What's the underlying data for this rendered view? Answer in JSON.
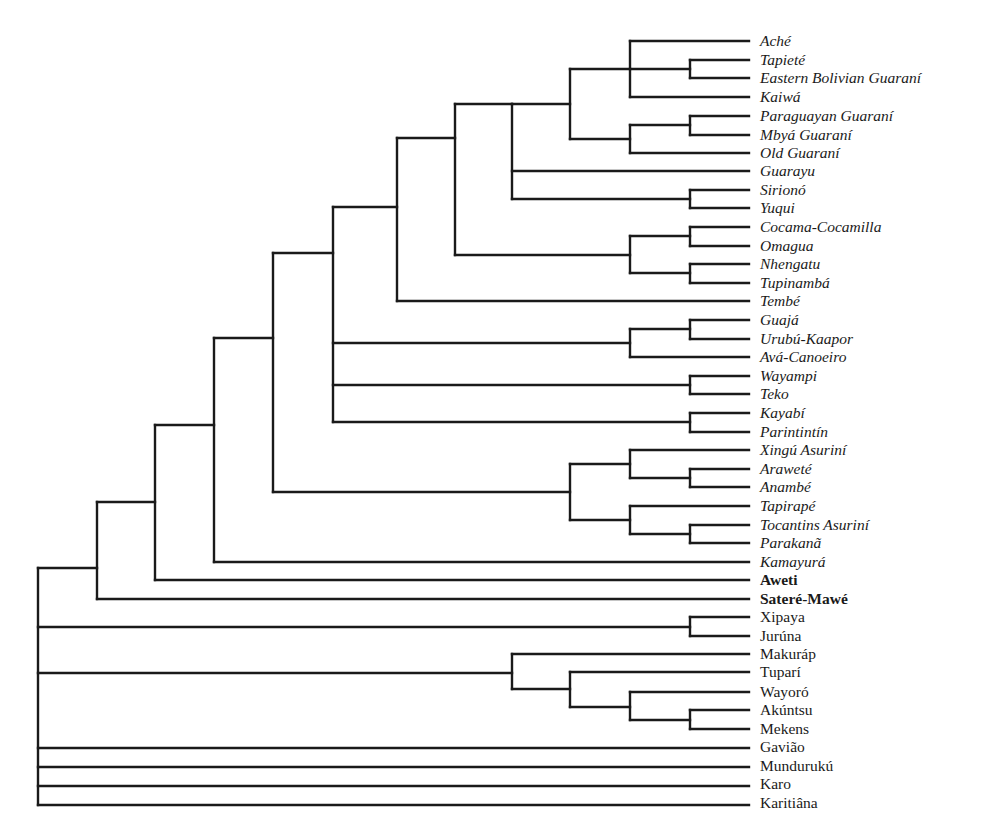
{
  "diagram": {
    "type": "phylogenetic-tree",
    "line_color": "#1a1a1a",
    "label_x": 760,
    "tip_x": 749,
    "leaves": [
      {
        "label": "Aché",
        "y": 41,
        "style": "italic"
      },
      {
        "label": "Tapieté",
        "y": 60,
        "style": "italic"
      },
      {
        "label": "Eastern Bolivian Guaraní",
        "y": 78,
        "style": "italic"
      },
      {
        "label": "Kaiwá",
        "y": 97,
        "style": "italic"
      },
      {
        "label": "Paraguayan Guaraní",
        "y": 116,
        "style": "italic"
      },
      {
        "label": "Mbyá Guaraní",
        "y": 135,
        "style": "italic"
      },
      {
        "label": "Old Guaraní",
        "y": 153,
        "style": "italic"
      },
      {
        "label": "Guarayu",
        "y": 171,
        "style": "italic"
      },
      {
        "label": "Sirionó",
        "y": 190,
        "style": "italic"
      },
      {
        "label": "Yuqui",
        "y": 208,
        "style": "italic"
      },
      {
        "label": "Cocama-Cocamilla",
        "y": 227,
        "style": "italic"
      },
      {
        "label": "Omagua",
        "y": 246,
        "style": "italic"
      },
      {
        "label": "Nhengatu",
        "y": 264,
        "style": "italic"
      },
      {
        "label": "Tupinambá",
        "y": 283,
        "style": "italic"
      },
      {
        "label": "Tembé",
        "y": 301,
        "style": "italic"
      },
      {
        "label": "Guajá",
        "y": 320,
        "style": "italic"
      },
      {
        "label": "Urubú-Kaapor",
        "y": 339,
        "style": "italic"
      },
      {
        "label": "Avá-Canoeiro",
        "y": 357,
        "style": "italic"
      },
      {
        "label": "Wayampi",
        "y": 376,
        "style": "italic"
      },
      {
        "label": "Teko",
        "y": 394,
        "style": "italic"
      },
      {
        "label": "Kayabí",
        "y": 413,
        "style": "italic"
      },
      {
        "label": "Parintintín",
        "y": 432,
        "style": "italic"
      },
      {
        "label": "Xingú Asuriní",
        "y": 450,
        "style": "italic"
      },
      {
        "label": "Araweté",
        "y": 469,
        "style": "italic"
      },
      {
        "label": "Anambé",
        "y": 487,
        "style": "italic"
      },
      {
        "label": "Tapirapé",
        "y": 506,
        "style": "italic"
      },
      {
        "label": "Tocantins Asuriní",
        "y": 525,
        "style": "italic"
      },
      {
        "label": "Parakanã",
        "y": 543,
        "style": "italic"
      },
      {
        "label": "Kamayurá",
        "y": 562,
        "style": "italic"
      },
      {
        "label": "Aweti",
        "y": 580,
        "style": "bold"
      },
      {
        "label": "Sateré-Mawé",
        "y": 599,
        "style": "bold"
      },
      {
        "label": "Xipaya",
        "y": 617,
        "style": "normal"
      },
      {
        "label": "Jurúna",
        "y": 636,
        "style": "normal"
      },
      {
        "label": "Makuráp",
        "y": 654,
        "style": "normal"
      },
      {
        "label": "Tuparí",
        "y": 672,
        "style": "normal"
      },
      {
        "label": "Wayoró",
        "y": 692,
        "style": "normal"
      },
      {
        "label": "Akúntsu",
        "y": 710,
        "style": "normal"
      },
      {
        "label": "Mekens",
        "y": 729,
        "style": "normal"
      },
      {
        "label": "Gavião",
        "y": 747,
        "style": "normal"
      },
      {
        "label": "Mundurukú",
        "y": 766,
        "style": "normal"
      },
      {
        "label": "Karo",
        "y": 784,
        "style": "normal"
      },
      {
        "label": "Karitiâna",
        "y": 803,
        "style": "normal"
      }
    ],
    "nodes": [
      {
        "x": 690,
        "y1": 60,
        "y2": 78,
        "children": [
          {
            "y": 60,
            "to": 749
          },
          {
            "y": 78,
            "to": 749
          }
        ],
        "y": 69
      },
      {
        "x": 630,
        "y1": 41,
        "y2": 97,
        "children": [
          {
            "y": 41,
            "to": 749
          },
          {
            "y": 69,
            "to": 690
          },
          {
            "y": 97,
            "to": 749
          }
        ],
        "y": 69
      },
      {
        "x": 690,
        "y1": 116,
        "y2": 135,
        "children": [
          {
            "y": 116,
            "to": 749
          },
          {
            "y": 135,
            "to": 749
          }
        ],
        "y": 125
      },
      {
        "x": 630,
        "y1": 125,
        "y2": 153,
        "children": [
          {
            "y": 125,
            "to": 690
          },
          {
            "y": 153,
            "to": 749
          }
        ],
        "y": 139
      },
      {
        "x": 570,
        "y1": 69,
        "y2": 139,
        "children": [
          {
            "y": 69,
            "to": 630
          },
          {
            "y": 139,
            "to": 630
          }
        ],
        "y": 104
      },
      {
        "x": 690,
        "y1": 190,
        "y2": 208,
        "children": [
          {
            "y": 190,
            "to": 749
          },
          {
            "y": 208,
            "to": 749
          }
        ],
        "y": 199
      },
      {
        "x": 512,
        "y1": 104,
        "y2": 199,
        "children": [
          {
            "y": 104,
            "to": 570
          },
          {
            "y": 171,
            "to": 749
          },
          {
            "y": 199,
            "to": 690
          }
        ],
        "y": 104
      },
      {
        "x": 690,
        "y1": 227,
        "y2": 246,
        "children": [
          {
            "y": 227,
            "to": 749
          },
          {
            "y": 246,
            "to": 749
          }
        ],
        "y": 236
      },
      {
        "x": 690,
        "y1": 264,
        "y2": 283,
        "children": [
          {
            "y": 264,
            "to": 749
          },
          {
            "y": 283,
            "to": 749
          }
        ],
        "y": 273
      },
      {
        "x": 630,
        "y1": 236,
        "y2": 273,
        "children": [
          {
            "y": 236,
            "to": 690
          },
          {
            "y": 273,
            "to": 690
          }
        ],
        "y": 255
      },
      {
        "x": 455,
        "y1": 104,
        "y2": 255,
        "children": [
          {
            "y": 104,
            "to": 512
          },
          {
            "y": 255,
            "to": 630
          }
        ],
        "y": 138
      },
      {
        "x": 397,
        "y1": 138,
        "y2": 301,
        "children": [
          {
            "y": 138,
            "to": 455
          },
          {
            "y": 301,
            "to": 749
          }
        ],
        "y": 207
      },
      {
        "x": 690,
        "y1": 320,
        "y2": 339,
        "children": [
          {
            "y": 320,
            "to": 749
          },
          {
            "y": 339,
            "to": 749
          }
        ],
        "y": 329
      },
      {
        "x": 630,
        "y1": 329,
        "y2": 357,
        "children": [
          {
            "y": 329,
            "to": 690
          },
          {
            "y": 357,
            "to": 749
          }
        ],
        "y": 343
      },
      {
        "x": 690,
        "y1": 376,
        "y2": 394,
        "children": [
          {
            "y": 376,
            "to": 749
          },
          {
            "y": 394,
            "to": 749
          }
        ],
        "y": 385
      },
      {
        "x": 690,
        "y1": 413,
        "y2": 432,
        "children": [
          {
            "y": 413,
            "to": 749
          },
          {
            "y": 432,
            "to": 749
          }
        ],
        "y": 422
      },
      {
        "x": 333,
        "y1": 207,
        "y2": 422,
        "children": [
          {
            "y": 207,
            "to": 397
          },
          {
            "y": 343,
            "to": 630
          },
          {
            "y": 385,
            "to": 690
          },
          {
            "y": 422,
            "to": 690
          }
        ],
        "y": 253
      },
      {
        "x": 690,
        "y1": 469,
        "y2": 487,
        "children": [
          {
            "y": 469,
            "to": 749
          },
          {
            "y": 487,
            "to": 749
          }
        ],
        "y": 478
      },
      {
        "x": 630,
        "y1": 450,
        "y2": 478,
        "children": [
          {
            "y": 450,
            "to": 749
          },
          {
            "y": 478,
            "to": 690
          }
        ],
        "y": 464
      },
      {
        "x": 690,
        "y1": 525,
        "y2": 543,
        "children": [
          {
            "y": 525,
            "to": 749
          },
          {
            "y": 543,
            "to": 749
          }
        ],
        "y": 534
      },
      {
        "x": 630,
        "y1": 506,
        "y2": 534,
        "children": [
          {
            "y": 506,
            "to": 749
          },
          {
            "y": 534,
            "to": 690
          }
        ],
        "y": 520
      },
      {
        "x": 570,
        "y1": 464,
        "y2": 520,
        "children": [
          {
            "y": 464,
            "to": 630
          },
          {
            "y": 520,
            "to": 630
          }
        ],
        "y": 492
      },
      {
        "x": 273,
        "y1": 253,
        "y2": 492,
        "children": [
          {
            "y": 253,
            "to": 333
          },
          {
            "y": 492,
            "to": 570
          }
        ],
        "y": 338
      },
      {
        "x": 214,
        "y1": 338,
        "y2": 562,
        "children": [
          {
            "y": 338,
            "to": 273
          },
          {
            "y": 562,
            "to": 749
          }
        ],
        "y": 425
      },
      {
        "x": 155,
        "y1": 425,
        "y2": 580,
        "children": [
          {
            "y": 425,
            "to": 214
          },
          {
            "y": 580,
            "to": 749
          }
        ],
        "y": 502
      },
      {
        "x": 97,
        "y1": 502,
        "y2": 599,
        "children": [
          {
            "y": 502,
            "to": 155
          },
          {
            "y": 599,
            "to": 749
          }
        ],
        "y": 568
      },
      {
        "x": 690,
        "y1": 617,
        "y2": 636,
        "children": [
          {
            "y": 617,
            "to": 749
          },
          {
            "y": 636,
            "to": 749
          }
        ],
        "y": 627
      },
      {
        "x": 690,
        "y1": 710,
        "y2": 729,
        "children": [
          {
            "y": 710,
            "to": 749
          },
          {
            "y": 729,
            "to": 749
          }
        ],
        "y": 720
      },
      {
        "x": 630,
        "y1": 692,
        "y2": 720,
        "children": [
          {
            "y": 692,
            "to": 749
          },
          {
            "y": 720,
            "to": 690
          }
        ],
        "y": 707
      },
      {
        "x": 570,
        "y1": 672,
        "y2": 707,
        "children": [
          {
            "y": 672,
            "to": 749
          },
          {
            "y": 707,
            "to": 630
          }
        ],
        "y": 689
      },
      {
        "x": 512,
        "y1": 654,
        "y2": 689,
        "children": [
          {
            "y": 654,
            "to": 749
          },
          {
            "y": 689,
            "to": 570
          }
        ],
        "y": 673
      },
      {
        "x": 38,
        "y1": 568,
        "y2": 805,
        "children": [
          {
            "y": 568,
            "to": 97
          },
          {
            "y": 627,
            "to": 690
          },
          {
            "y": 673,
            "to": 512
          },
          {
            "y": 748,
            "to": 749
          },
          {
            "y": 767,
            "to": 749
          },
          {
            "y": 786,
            "to": 749
          },
          {
            "y": 805,
            "to": 749
          }
        ],
        "y": 686
      }
    ]
  }
}
